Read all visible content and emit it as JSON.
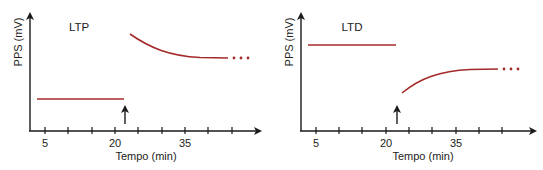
{
  "panels": [
    {
      "id": "ltp",
      "title": "LTP",
      "ylabel": "PPS (mV)",
      "xlabel": "Tempo (min)",
      "xticks_labeled": [
        {
          "value": "5",
          "tick_index": 0
        },
        {
          "value": "20",
          "tick_index": 3
        },
        {
          "value": "35",
          "tick_index": 6
        }
      ],
      "tick_count": 9,
      "baseline": {
        "level": "low",
        "from_min": 5,
        "to_min": 21
      },
      "stimulus_arrow_min": 21,
      "after": {
        "shape": "decaying curve from high to plateau",
        "continues": "..."
      }
    },
    {
      "id": "ltd",
      "title": "LTD",
      "ylabel": "PPS (mV)",
      "xlabel": "Tempo (min)",
      "xticks_labeled": [
        {
          "value": "5",
          "tick_index": 0
        },
        {
          "value": "20",
          "tick_index": 3
        },
        {
          "value": "35",
          "tick_index": 6
        }
      ],
      "tick_count": 9,
      "baseline": {
        "level": "high",
        "from_min": 5,
        "to_min": 21
      },
      "stimulus_arrow_min": 21,
      "after": {
        "shape": "rising curve from low to plateau",
        "continues": "..."
      }
    }
  ],
  "colors": {
    "trace": "#a52a2a",
    "axis": "#1a1a1a",
    "text": "#222222"
  }
}
